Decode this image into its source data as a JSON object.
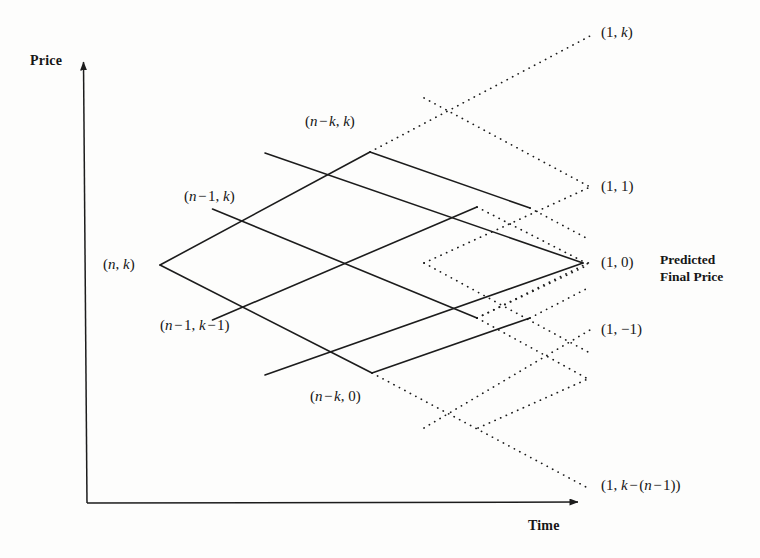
{
  "figure": {
    "kind": "binomial-lattice-diagram",
    "background_color": "#fdfdfc",
    "line_color": "#1c1c1c",
    "axes": {
      "y_label": "Price",
      "x_label": "Time",
      "origin": [
        87,
        503
      ],
      "y_tip": [
        83,
        55
      ],
      "x_tip": [
        586,
        502
      ]
    },
    "side_note": "Predicted\nFinal Price",
    "side_note_line1": "Predicted",
    "side_note_line2": "Final Price"
  },
  "nodes": [
    {
      "id": "n-k",
      "label": "(n, k)",
      "x": 160,
      "y": 265,
      "label_x": 103,
      "label_y": 256,
      "style": "solid"
    },
    {
      "id": "n-1-k",
      "label": "(n − 1, k)",
      "x": 265,
      "y": 208,
      "label_x": 184,
      "label_y": 188,
      "style": "solid"
    },
    {
      "id": "n-1-k-1",
      "label": "(n − 1, k − 1)",
      "x": 265,
      "y": 319,
      "label_x": 160,
      "label_y": 317,
      "style": "solid"
    },
    {
      "id": "n-k-k",
      "label": "(n − k, k)",
      "x": 370,
      "y": 152,
      "label_x": 305,
      "label_y": 113,
      "style": "solid"
    },
    {
      "id": "n-k-0",
      "label": "(n − k, 0)",
      "x": 372,
      "y": 373,
      "label_x": 310,
      "label_y": 388,
      "style": "solid"
    },
    {
      "id": "1-k",
      "label": "(1, k)",
      "x": 592,
      "y": 35,
      "label_x": 601,
      "label_y": 24,
      "style": "dotted"
    },
    {
      "id": "1-1",
      "label": "(1, 1)",
      "x": 588,
      "y": 188,
      "label_x": 601,
      "label_y": 178,
      "style": "dotted"
    },
    {
      "id": "1-0",
      "label": "(1, 0)",
      "x": 583,
      "y": 263,
      "label_x": 601,
      "label_y": 254,
      "style": "solid"
    },
    {
      "id": "1-minus-1",
      "label": "(1, −1)",
      "x": 588,
      "y": 330,
      "label_x": 601,
      "label_y": 321,
      "style": "dotted"
    },
    {
      "id": "1-k-minus-n-1",
      "label": "(1, k − (n − 1))",
      "x": 586,
      "y": 487,
      "label_x": 601,
      "label_y": 477,
      "style": "dotted"
    }
  ],
  "chart_data": {
    "type": "diagram",
    "title": "",
    "xlabel": "Time",
    "ylabel": "Price",
    "solid_grid": {
      "rows": 3,
      "cols": 3,
      "left_apex": [
        160,
        265
      ],
      "top_apex": [
        370,
        152
      ],
      "right_apex": [
        583,
        263
      ],
      "bottom_apex": [
        372,
        373
      ]
    },
    "dotted_extensions": [
      "upper-right toward (1, k)",
      "upper-right toward (1, 1)",
      "lower-right toward (1, -1)",
      "lower-right toward (1, k - (n - 1))"
    ]
  }
}
